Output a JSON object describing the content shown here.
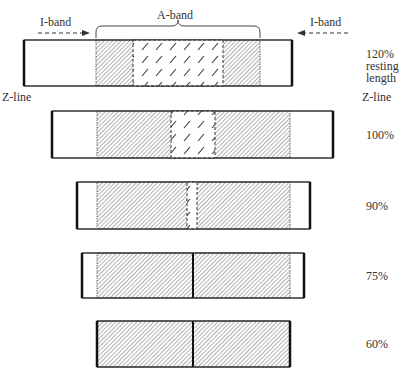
{
  "labels": {
    "i_band_left": "I-band",
    "i_band_right": "I-band",
    "a_band": "A-band",
    "z_line_left": "Z-line",
    "z_line_right": "Z-line",
    "resting_line1": "120%",
    "resting_line2": "resting",
    "resting_line3": "length"
  },
  "rows": [
    {
      "label": "120%",
      "y": 40,
      "h": 46,
      "z_left": 24,
      "z_right": 292,
      "a_left": 96,
      "a_right": 260,
      "h_left": 133,
      "h_right": 223,
      "m_line": false
    },
    {
      "label": "100%",
      "y": 111,
      "h": 47,
      "z_left": 52,
      "z_right": 333,
      "a_left": 97,
      "a_right": 290,
      "h_left": 171,
      "h_right": 215,
      "m_line": false
    },
    {
      "label": "90%",
      "y": 182,
      "h": 47,
      "z_left": 77,
      "z_right": 310,
      "a_left": 97,
      "a_right": 290,
      "h_left": 187,
      "h_right": 197,
      "m_line": false
    },
    {
      "label": "75%",
      "y": 253,
      "h": 45,
      "z_left": 82,
      "z_right": 304,
      "a_left": 97,
      "a_right": 290,
      "h_left": 193,
      "h_right": 193,
      "m_line": true
    },
    {
      "label": "60%",
      "y": 321,
      "h": 46,
      "z_left": 97,
      "z_right": 290,
      "a_left": 97,
      "a_right": 290,
      "h_left": 193,
      "h_right": 193,
      "m_line": true
    }
  ],
  "colors": {
    "outline": "#222222",
    "hatch": "#555555",
    "background": "#ffffff"
  }
}
